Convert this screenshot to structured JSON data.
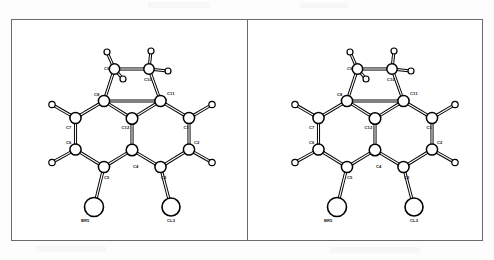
{
  "figure": {
    "kind": "stereo-pair-ortep-crystal-structure",
    "panel_count": 2,
    "left_panel_label": "left stereo view",
    "right_panel_label": "right stereo view",
    "line_color": "#000000",
    "atom_fill": "#ffffff",
    "frame_color": "#6b6b6b",
    "background": "#ffffff"
  },
  "molecule": {
    "carbon_labels": [
      "C1",
      "C2",
      "C3",
      "C4",
      "C5",
      "C6",
      "C7",
      "C8",
      "C9",
      "C10",
      "C11",
      "C12"
    ],
    "halogen_labels": [
      "BR5",
      "CL3"
    ],
    "atoms": [
      {
        "id": "C9",
        "label": "C9",
        "x": 103.5,
        "y": 50.0,
        "r": 5.2,
        "type": "carbon",
        "lx": 93.0,
        "ly": 50.5
      },
      {
        "id": "C10",
        "label": "C10",
        "x": 138.0,
        "y": 50.0,
        "r": 5.2,
        "type": "carbon",
        "lx": 133.0,
        "ly": 62.0
      },
      {
        "id": "C8",
        "label": "C8",
        "x": 93.0,
        "y": 82.0,
        "r": 5.6,
        "type": "carbon",
        "lx": 83.0,
        "ly": 76.5
      },
      {
        "id": "C11",
        "label": "C11",
        "x": 149.5,
        "y": 82.0,
        "r": 5.6,
        "type": "carbon",
        "lx": 156.0,
        "ly": 76.0
      },
      {
        "id": "C12",
        "label": "C12",
        "x": 121.0,
        "y": 99.5,
        "r": 5.8,
        "type": "carbon",
        "lx": 110.5,
        "ly": 110.0
      },
      {
        "id": "C7",
        "label": "C7",
        "x": 64.5,
        "y": 99.0,
        "r": 5.6,
        "type": "carbon",
        "lx": 55.0,
        "ly": 110.0
      },
      {
        "id": "C1",
        "label": "C1",
        "x": 178.0,
        "y": 99.0,
        "r": 5.6,
        "type": "carbon",
        "lx": 172.5,
        "ly": 110.0
      },
      {
        "id": "C6",
        "label": "C6",
        "x": 64.5,
        "y": 130.5,
        "r": 5.6,
        "type": "carbon",
        "lx": 55.0,
        "ly": 125.0
      },
      {
        "id": "C2",
        "label": "C2",
        "x": 178.0,
        "y": 130.5,
        "r": 5.6,
        "type": "carbon",
        "lx": 183.0,
        "ly": 125.0
      },
      {
        "id": "C5",
        "label": "C5",
        "x": 93.0,
        "y": 148.0,
        "r": 5.6,
        "type": "carbon",
        "lx": 93.0,
        "ly": 160.0
      },
      {
        "id": "C4",
        "label": "C4",
        "x": 121.0,
        "y": 131.0,
        "r": 5.8,
        "type": "carbon",
        "lx": 122.0,
        "ly": 148.5
      },
      {
        "id": "C3",
        "label": "C3",
        "x": 149.5,
        "y": 148.0,
        "r": 5.6,
        "type": "carbon",
        "lx": 150.0,
        "ly": 160.0
      },
      {
        "id": "BR5",
        "label": "BR5",
        "x": 83.0,
        "y": 188.0,
        "r": 9.5,
        "type": "halogen",
        "lx": 70.0,
        "ly": 203.0
      },
      {
        "id": "CL3",
        "label": "CL3",
        "x": 160.0,
        "y": 188.0,
        "r": 9.0,
        "type": "halogen",
        "lx": 156.0,
        "ly": 203.0
      }
    ],
    "hydrogens": [
      {
        "id": "H9A",
        "x": 96.0,
        "y": 33.0,
        "r": 3.0
      },
      {
        "id": "H9B",
        "x": 112.0,
        "y": 60.0,
        "r": 3.0
      },
      {
        "id": "H10A",
        "x": 140.0,
        "y": 32.0,
        "r": 3.0
      },
      {
        "id": "H10B",
        "x": 157.0,
        "y": 52.0,
        "r": 3.0
      },
      {
        "id": "H7",
        "x": 41.0,
        "y": 85.5,
        "r": 3.2
      },
      {
        "id": "H1",
        "x": 201.0,
        "y": 85.5,
        "r": 3.2
      },
      {
        "id": "H6",
        "x": 41.0,
        "y": 143.5,
        "r": 3.2
      },
      {
        "id": "H2",
        "x": 201.0,
        "y": 143.5,
        "r": 3.2
      }
    ],
    "bonds": [
      {
        "from": "C9",
        "to": "C10"
      },
      {
        "from": "C9",
        "to": "C8"
      },
      {
        "from": "C10",
        "to": "C11"
      },
      {
        "from": "C8",
        "to": "C11"
      },
      {
        "from": "C8",
        "to": "C12"
      },
      {
        "from": "C11",
        "to": "C12"
      },
      {
        "from": "C8",
        "to": "C7"
      },
      {
        "from": "C11",
        "to": "C1"
      },
      {
        "from": "C7",
        "to": "C6"
      },
      {
        "from": "C1",
        "to": "C2"
      },
      {
        "from": "C6",
        "to": "C5"
      },
      {
        "from": "C2",
        "to": "C3"
      },
      {
        "from": "C12",
        "to": "C4"
      },
      {
        "from": "C5",
        "to": "C4"
      },
      {
        "from": "C4",
        "to": "C3"
      },
      {
        "from": "C5",
        "to": "BR5"
      },
      {
        "from": "C3",
        "to": "CL3"
      }
    ],
    "h_bonds": [
      {
        "from": "C9",
        "to": "H9A"
      },
      {
        "from": "C9",
        "to": "H9B"
      },
      {
        "from": "C10",
        "to": "H10A"
      },
      {
        "from": "C10",
        "to": "H10B"
      },
      {
        "from": "C7",
        "to": "H7"
      },
      {
        "from": "C1",
        "to": "H1"
      },
      {
        "from": "C6",
        "to": "H6"
      },
      {
        "from": "C2",
        "to": "H2"
      }
    ]
  }
}
